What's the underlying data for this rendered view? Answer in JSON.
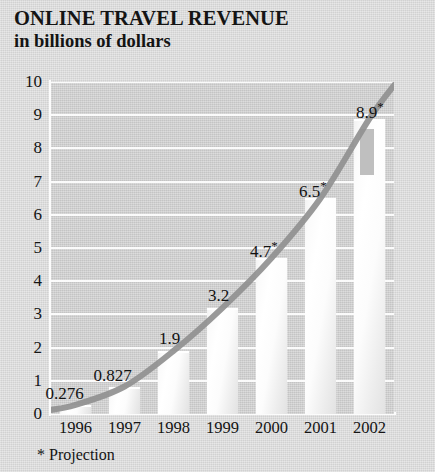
{
  "title": {
    "main": "ONLINE TRAVEL REVENUE",
    "sub": "in billions of dollars"
  },
  "footnote": "* Projection",
  "colors": {
    "page_background": "#d9d9d9",
    "plot_background": "#cfcfcf",
    "gridline": "#fbfbfb",
    "bar_fill": "#ffffff",
    "bar_shade": "#b4b4b4",
    "trend_line": "#909090",
    "text": "#141414"
  },
  "chart_data": {
    "type": "bar",
    "title": "ONLINE TRAVEL REVENUE",
    "subtitle": "in billions of dollars",
    "xlabel": "",
    "ylabel": "in billions of dollars",
    "ylim": [
      0,
      10
    ],
    "yticks": [
      0,
      1,
      2,
      3,
      4,
      5,
      6,
      7,
      8,
      9,
      10
    ],
    "ytick_labels": [
      "0",
      "1",
      "2",
      "3",
      "4",
      "5",
      "6",
      "7",
      "8",
      "9",
      "10"
    ],
    "grid": true,
    "legend": false,
    "categories": [
      "1996",
      "1997",
      "1998",
      "1999",
      "2000",
      "2001",
      "2002"
    ],
    "values": [
      0.276,
      0.827,
      1.9,
      3.2,
      4.7,
      6.5,
      8.9
    ],
    "data_labels": [
      "0.276",
      "0.827",
      "1.9",
      "3.2",
      "4.7*",
      "6.5*",
      "8.9*"
    ],
    "projected": [
      false,
      false,
      false,
      false,
      true,
      true,
      true
    ],
    "annotations": [
      "* Projection"
    ],
    "overlay_series": {
      "name": "trend curve",
      "type": "line",
      "values": [
        0.276,
        0.827,
        1.9,
        3.2,
        4.7,
        6.5,
        8.9
      ]
    }
  }
}
